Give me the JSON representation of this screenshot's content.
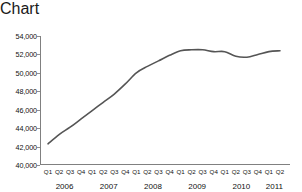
{
  "chart_data": {
    "type": "line",
    "title": "",
    "xlabel": "",
    "ylabel": "",
    "ylim": [
      40000,
      54000
    ],
    "ytick_step": 2000,
    "grid": false,
    "legend": null,
    "line_color": "#555555",
    "axis_color": "#808080",
    "ytick_labels": [
      "54,000",
      "52,000",
      "50,000",
      "48,000",
      "46,000",
      "44,000",
      "42,000",
      "40,000"
    ],
    "ytick_values": [
      54000,
      52000,
      50000,
      48000,
      46000,
      44000,
      42000,
      40000
    ],
    "quarter_labels": [
      "Q1",
      "Q2",
      "Q3",
      "Q4",
      "Q1",
      "Q2",
      "Q3",
      "Q4",
      "Q1",
      "Q2",
      "Q3",
      "Q4",
      "Q1",
      "Q2",
      "Q3",
      "Q4",
      "Q1",
      "Q2",
      "Q3",
      "Q4",
      "Q1",
      "Q2"
    ],
    "year_labels": [
      "2006",
      "2007",
      "2008",
      "2009",
      "2010",
      "2011"
    ],
    "year_spans": [
      4,
      4,
      4,
      4,
      4,
      2
    ],
    "categories": [
      "2006 Q1",
      "2006 Q2",
      "2006 Q3",
      "2006 Q4",
      "2007 Q1",
      "2007 Q2",
      "2007 Q3",
      "2007 Q4",
      "2008 Q1",
      "2008 Q2",
      "2008 Q3",
      "2008 Q4",
      "2009 Q1",
      "2009 Q2",
      "2009 Q3",
      "2009 Q4",
      "2010 Q1",
      "2010 Q2",
      "2010 Q3",
      "2010 Q4",
      "2011 Q1",
      "2011 Q2"
    ],
    "values": [
      42300,
      43300,
      44100,
      45000,
      45900,
      46800,
      47700,
      48800,
      50000,
      50700,
      51300,
      51900,
      52400,
      52500,
      52500,
      52300,
      52300,
      51800,
      51700,
      52000,
      52300,
      52400
    ]
  }
}
